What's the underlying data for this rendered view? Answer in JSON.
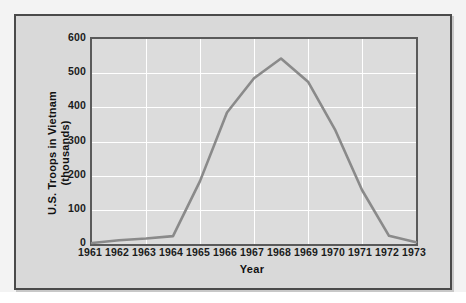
{
  "figure": {
    "frame_color": "#4a4a4a",
    "panel_bg": "#d9d9d9",
    "plot_bg": "#dcdcdc",
    "grid_color": "#ffffff",
    "line_color": "#8a8a8a"
  },
  "chart_data": {
    "type": "line",
    "title": "",
    "xlabel": "Year",
    "ylabel": "U.S. Troops in Vietnam (thousands)",
    "ylabel_line1": "U.S. Troops in Vietnam",
    "ylabel_line2": "(thousands)",
    "categories": [
      "1961",
      "1962",
      "1963",
      "1964",
      "1965",
      "1966",
      "1967",
      "1968",
      "1969",
      "1970",
      "1971",
      "1972",
      "1973"
    ],
    "x": [
      1961,
      1962,
      1963,
      1964,
      1965,
      1966,
      1967,
      1968,
      1969,
      1970,
      1971,
      1972,
      1973
    ],
    "values": [
      3,
      11,
      16,
      23,
      184,
      385,
      485,
      543,
      475,
      335,
      158,
      24,
      5
    ],
    "xlim": [
      1961,
      1973
    ],
    "ylim": [
      0,
      600
    ],
    "yticks": [
      0,
      100,
      200,
      300,
      400,
      500,
      600
    ],
    "ytick_labels": [
      "0",
      "100",
      "200",
      "300",
      "400",
      "500",
      "600"
    ],
    "xtick_labels": [
      "1961",
      "1962",
      "1963",
      "1964",
      "1965",
      "1966",
      "1967",
      "1968",
      "1969",
      "1970",
      "1971",
      "1972",
      "1973"
    ],
    "grid": true,
    "legend": null,
    "series": [
      {
        "name": "U.S. Troops in Vietnam",
        "values": [
          3,
          11,
          16,
          23,
          184,
          385,
          485,
          543,
          475,
          335,
          158,
          24,
          5
        ]
      }
    ]
  }
}
